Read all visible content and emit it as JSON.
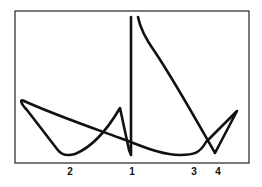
{
  "diagram": {
    "frame": {
      "x": 15,
      "y": 11,
      "width": 234,
      "height": 152
    },
    "stroke_color": "#111111",
    "stroke_width": 2.6,
    "curves": [
      {
        "name": "main-curve",
        "d": "M 24 101 C 19 98 21 104 27 110 L 57 149 C 62 156 68 156 75 154 C 95 146 110 125 120 108 L 129 150 L 131 155 L 131 17"
      },
      {
        "name": "descending-curve",
        "d": "M 138 17 C 140 28 145 38 155 52 C 175 82 195 118 215 153 L 237 111 L 206 142 C 200 153 194 155 180 155 C 160 155 140 145 120 138 C 90 127 55 115 24 101"
      }
    ],
    "labels": [
      {
        "text": "2",
        "x": 70,
        "y": 167
      },
      {
        "text": "1",
        "x": 132,
        "y": 167
      },
      {
        "text": "3",
        "x": 194,
        "y": 167
      },
      {
        "text": "4",
        "x": 218,
        "y": 167
      }
    ]
  }
}
